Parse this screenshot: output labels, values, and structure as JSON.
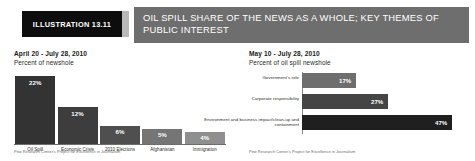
{
  "header": {
    "illustration_label": "ILLUSTRATION 13.11",
    "title": "OIL SPILL SHARE OF THE NEWS AS A WHOLE; KEY THEMES OF PUBLIC INTEREST",
    "bar_color": "#6e6e6e",
    "box_color": "#0d0d0d",
    "tab_color": "#b9b9b9"
  },
  "left_panel": {
    "title": "April 20 - July 28, 2010",
    "subtitle": "Percent of newshole",
    "footnote": "Pew Research Center's Project for Excellence in Journalism"
  },
  "right_panel": {
    "title": "May 10 - July 28, 2010",
    "subtitle": "Percent of oil spill newshole",
    "footnote": "Pew Research Center's Project for Excellence in Journalism"
  },
  "chart_data": [
    {
      "type": "bar",
      "orientation": "vertical",
      "title": "April 20 - July 28, 2010",
      "subtitle": "Percent of newshole",
      "xlabel": "",
      "ylabel": "Percent of newshole",
      "ylim": [
        0,
        24
      ],
      "grid": false,
      "legend": "none",
      "categories": [
        "Oil Spill",
        "Economic Crisis",
        "2010 Elections",
        "Afghanistan",
        "Immigration"
      ],
      "values": [
        22,
        12,
        6,
        5,
        4
      ],
      "value_labels": [
        "22%",
        "12%",
        "6%",
        "5%",
        "4%"
      ],
      "bar_colors": [
        "#333333",
        "#3d3d3d",
        "#4f4f4f",
        "#757575",
        "#8f8f8f"
      ]
    },
    {
      "type": "bar",
      "orientation": "horizontal",
      "title": "May 10 - July 28, 2010",
      "subtitle": "Percent of oil spill newshole",
      "xlabel": "Percent of oil spill newshole",
      "ylabel": "",
      "xlim": [
        0,
        50
      ],
      "grid": false,
      "legend": "none",
      "categories": [
        "Government's role",
        "Corporate responsibility",
        "Environment and business impact/clean-up and containment"
      ],
      "values": [
        17,
        27,
        47
      ],
      "value_labels": [
        "17%",
        "27%",
        "47%"
      ],
      "bar_colors": [
        "#6e6e6e",
        "#454545",
        "#1f1f1f"
      ]
    }
  ]
}
